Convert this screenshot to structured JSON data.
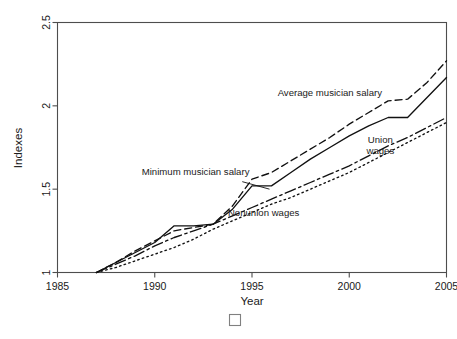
{
  "chart_data": {
    "type": "line",
    "title": "",
    "xlabel": "Year",
    "ylabel": "Indexes",
    "xlim": [
      1985,
      2005
    ],
    "ylim": [
      1,
      2.5
    ],
    "xticks": [
      1985,
      1990,
      1995,
      2000,
      2005
    ],
    "xtick_labels": [
      "1985",
      "1990",
      "1995",
      "2000",
      "2005"
    ],
    "yticks": [
      1,
      1.5,
      2,
      2.5
    ],
    "ytick_labels": [
      "1",
      "1.5",
      "2",
      "2.5"
    ],
    "grid": false,
    "legend": "inline annotations",
    "x": [
      1987,
      1988,
      1989,
      1990,
      1991,
      1992,
      1993,
      1994,
      1995,
      1996,
      1997,
      1998,
      1999,
      2000,
      2001,
      2002,
      2003,
      2004,
      2005
    ],
    "series": [
      {
        "name": "Minimum musician salary",
        "style": "solid",
        "values": [
          1.0,
          1.06,
          1.12,
          1.18,
          1.28,
          1.28,
          1.29,
          1.38,
          1.52,
          1.52,
          1.6,
          1.68,
          1.75,
          1.82,
          1.88,
          1.93,
          1.93,
          2.05,
          2.17
        ],
        "label_x": 1992.1,
        "label_y": 1.585,
        "leader_from": [
          1994.5,
          1.545
        ],
        "leader_to": [
          1995.9,
          1.5
        ]
      },
      {
        "name": "Average musician salary",
        "style": "dashed",
        "values": [
          1.0,
          1.06,
          1.13,
          1.19,
          1.25,
          1.27,
          1.29,
          1.4,
          1.56,
          1.6,
          1.67,
          1.74,
          1.81,
          1.89,
          1.96,
          2.03,
          2.04,
          2.14,
          2.27
        ],
        "label_x": 1999.0,
        "label_y": 2.06
      },
      {
        "name": "Union wages",
        "style": "dashdot",
        "values": [
          1.0,
          1.05,
          1.1,
          1.16,
          1.21,
          1.25,
          1.29,
          1.34,
          1.39,
          1.44,
          1.49,
          1.54,
          1.59,
          1.64,
          1.7,
          1.76,
          1.81,
          1.87,
          1.93
        ],
        "label_x": 2001.6,
        "label_y": 1.775
      },
      {
        "name": "Nonunion wages",
        "style": "dotted",
        "values": [
          1.0,
          1.03,
          1.07,
          1.11,
          1.15,
          1.2,
          1.26,
          1.31,
          1.36,
          1.41,
          1.45,
          1.5,
          1.55,
          1.6,
          1.66,
          1.72,
          1.78,
          1.84,
          1.9
        ],
        "label_x": 1995.6,
        "label_y": 1.34
      }
    ]
  },
  "axes": {
    "ylabel": "Indexes",
    "xlabel": "Year"
  },
  "footer": {
    "placeholder_glyph": "missing-glyph-box"
  },
  "colors": {
    "line": "#111111",
    "axis": "#4d4d4d",
    "text": "#1a1a1a",
    "background": "#ffffff"
  }
}
